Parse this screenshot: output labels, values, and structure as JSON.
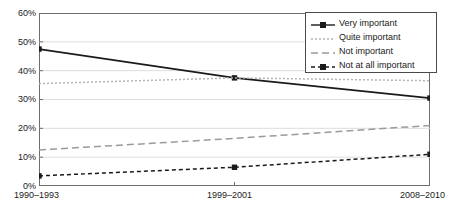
{
  "chart_data": {
    "type": "line",
    "title": "",
    "subtitle": "",
    "xlabel": "",
    "ylabel": "",
    "categories": [
      "1990–1993",
      "1999–2001",
      "2008–2010"
    ],
    "ylim": [
      0,
      60
    ],
    "ytick_values": [
      0,
      10,
      20,
      30,
      40,
      50,
      60
    ],
    "ytick_labels": [
      "0%",
      "10%",
      "20%",
      "30%",
      "40%",
      "50%",
      "60%"
    ],
    "grid": "horizontal",
    "legend_position": "top-right",
    "series": [
      {
        "name": "Very important",
        "values": [
          47.5,
          37.5,
          30.5
        ],
        "color": "#1a1a1a",
        "style": "solid",
        "marker": "square"
      },
      {
        "name": "Quite important",
        "values": [
          35.5,
          37.5,
          36.5
        ],
        "color": "#b4b4b4",
        "style": "dotted",
        "marker": "none"
      },
      {
        "name": "Not important",
        "values": [
          12.5,
          16.5,
          21.0
        ],
        "color": "#9a9a9a",
        "style": "dashed",
        "marker": "none"
      },
      {
        "name": "Not at all important",
        "values": [
          3.5,
          6.5,
          11.0
        ],
        "color": "#1a1a1a",
        "style": "dashed",
        "marker": "square"
      }
    ]
  },
  "axis": {
    "y_labels": [
      "60%",
      "50%",
      "40%",
      "30%",
      "20%",
      "10%",
      "0%"
    ],
    "x_labels": [
      "1990–1993",
      "1999–2001",
      "2008–2010"
    ]
  },
  "legend": {
    "items": [
      {
        "label": "Very important"
      },
      {
        "label": "Quite important"
      },
      {
        "label": "Not important"
      },
      {
        "label": "Not at all important"
      }
    ]
  },
  "colors": {
    "axis": "#6e6e6e",
    "grid": "#d9d9d9",
    "text": "#1a1a1a",
    "series_dark": "#1a1a1a",
    "series_light": "#b4b4b4",
    "series_mid": "#9a9a9a",
    "legend_border": "#4a4a4a"
  }
}
